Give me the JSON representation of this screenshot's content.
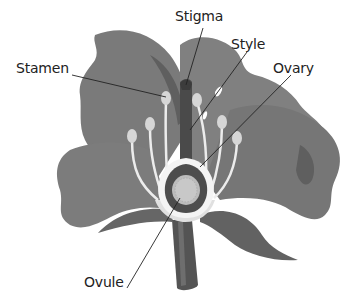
{
  "diagram": {
    "labels": {
      "stamen": "Stamen",
      "stigma": "Stigma",
      "style": "Style",
      "ovary": "Ovary",
      "ovule": "Ovule"
    },
    "colors": {
      "petal": "#7d7d7d",
      "petal_dark": "#5f5f5f",
      "leaf": "#6a6a6a",
      "stem": "#555555",
      "anther": "#d8d8d8",
      "filament": "#e6e6e6",
      "ovary_wall": "#f2f2f2",
      "ovule": "#bdbdbd",
      "leader_line": "#222222",
      "text": "#222222"
    }
  }
}
